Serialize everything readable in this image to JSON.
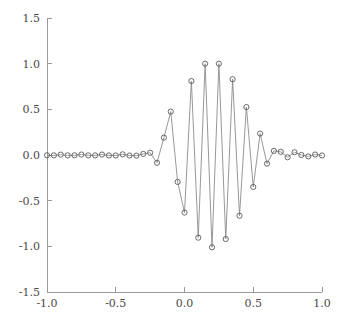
{
  "chart_data": {
    "type": "line",
    "title": "",
    "subtitle": "",
    "xlabel": "",
    "ylabel": "",
    "xlim": [
      -1.0,
      1.0
    ],
    "ylim": [
      -1.5,
      1.5
    ],
    "grid": false,
    "legend": null,
    "marker": "circle",
    "line_color": "#8c8c8c",
    "marker_color": "#5a5a5a",
    "xticks": [
      -1.0,
      -0.5,
      0.0,
      0.5,
      1.0
    ],
    "xtick_labels": [
      "-1.0",
      "-0.5",
      "0.0",
      "0.5",
      "1.0"
    ],
    "yticks": [
      -1.5,
      -1.0,
      -0.5,
      0.0,
      0.5,
      1.0,
      1.5
    ],
    "ytick_labels": [
      "-1.5",
      "-1.0",
      "-0.5",
      "0.0",
      "0.5",
      "1.0",
      "1.5"
    ],
    "series": [
      {
        "name": "wavelet",
        "x": [
          -1.0,
          -0.95,
          -0.9,
          -0.85,
          -0.8,
          -0.75,
          -0.7,
          -0.65,
          -0.6,
          -0.55,
          -0.5,
          -0.45,
          -0.4,
          -0.35,
          -0.3,
          -0.25,
          -0.2,
          -0.15,
          -0.1,
          -0.05,
          0.0,
          0.05,
          0.1,
          0.15,
          0.2,
          0.25,
          0.3,
          0.35,
          0.4,
          0.45,
          0.5,
          0.55,
          0.6,
          0.65,
          0.7,
          0.75,
          0.8,
          0.85,
          0.9,
          0.95,
          1.0
        ],
        "y": [
          -0.003,
          -0.004,
          0.004,
          -0.004,
          -0.003,
          0.005,
          -0.004,
          -0.004,
          0.005,
          -0.005,
          -0.005,
          0.007,
          -0.006,
          -0.007,
          0.012,
          0.025,
          -0.085,
          0.19,
          0.475,
          -0.295,
          -0.63,
          0.81,
          -0.905,
          1.0,
          -1.01,
          1.0,
          -0.92,
          0.83,
          -0.665,
          0.525,
          -0.35,
          0.235,
          -0.095,
          0.045,
          0.035,
          -0.025,
          0.03,
          0.0,
          -0.015,
          0.005,
          -0.005
        ]
      }
    ]
  },
  "axes": {
    "frame_color": "#9a9a9a"
  }
}
